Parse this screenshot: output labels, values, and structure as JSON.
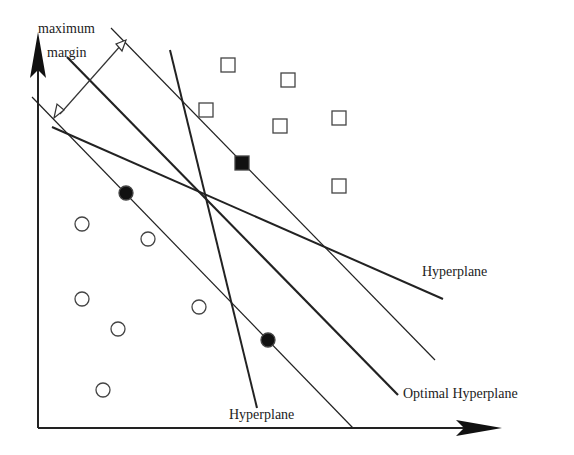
{
  "labels": {
    "margin_line1": "maximum",
    "margin_line2": "margin",
    "hyperplane_right": "Hyperplane",
    "hyperplane_bottom": "Hyperplane",
    "optimal": "Optimal Hyperplane"
  },
  "lines": {
    "upper_margin": [
      111,
      28,
      435,
      360
    ],
    "optimal": [
      67,
      57,
      398,
      395
    ],
    "lower_margin": [
      32,
      97,
      353,
      428
    ],
    "hyperplane_shallow": [
      52,
      127,
      443,
      299
    ],
    "hyperplane_steep": [
      170,
      50,
      257,
      408
    ]
  },
  "squares_open": [
    [
      228,
      65
    ],
    [
      288,
      80
    ],
    [
      206,
      110
    ],
    [
      280,
      126
    ],
    [
      339,
      118
    ],
    [
      339,
      186
    ]
  ],
  "squares_filled": [
    [
      242,
      163
    ]
  ],
  "circles_open": [
    [
      82,
      224
    ],
    [
      148,
      239
    ],
    [
      82,
      299
    ],
    [
      199,
      307
    ],
    [
      118,
      329
    ],
    [
      103,
      390
    ]
  ],
  "circles_filled": [
    [
      126,
      193
    ],
    [
      268,
      340
    ]
  ]
}
